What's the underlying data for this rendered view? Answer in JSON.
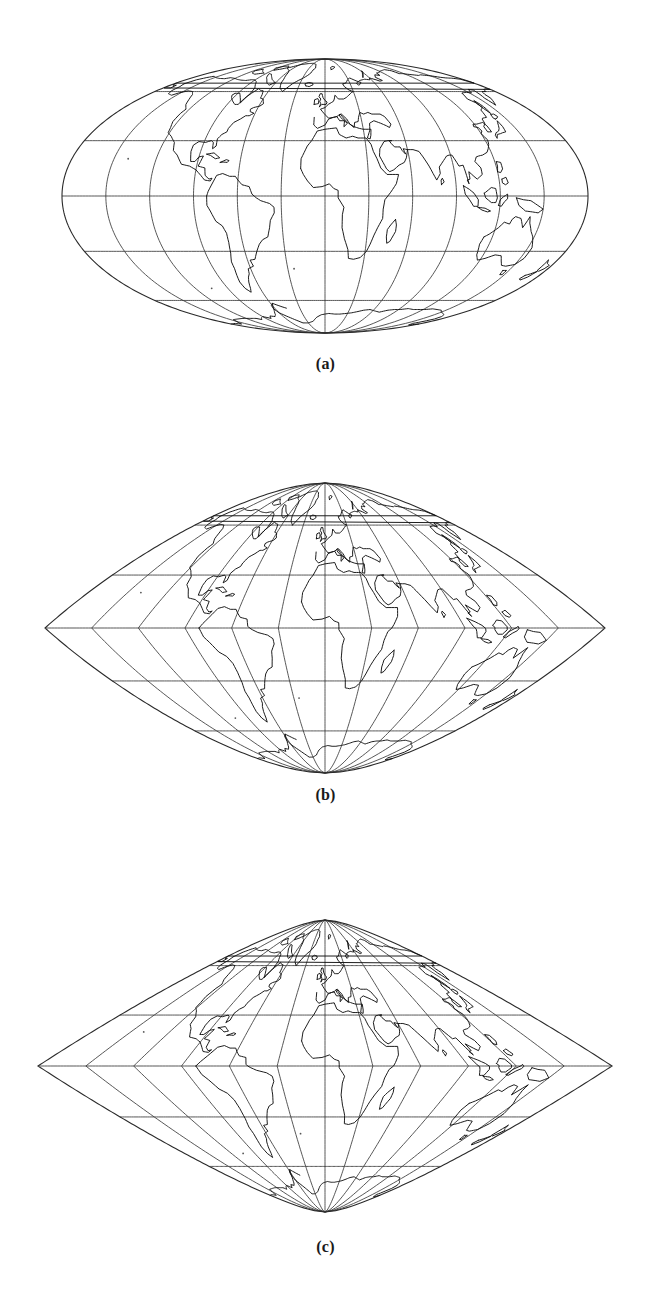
{
  "page": {
    "kind": "figure-plate",
    "background_color": "#ffffff",
    "ink_color": "#111111",
    "graticule_color": "#3a3a3a"
  },
  "figure": {
    "panels": [
      {
        "id": "a",
        "caption": "(a)",
        "projection_name": "Mollweide (flat-pole pseudocylindrical)",
        "pole_style": "flat",
        "center_x": 325,
        "center_y": 196,
        "semi_width": 263,
        "semi_height": 137
      },
      {
        "id": "b",
        "caption": "(b)",
        "projection_name": "Pointed-pole pseudocylindrical (intermediate)",
        "pole_style": "pointed",
        "center_x": 325,
        "center_y": 628,
        "semi_width": 280,
        "semi_height": 145
      },
      {
        "id": "c",
        "caption": "(c)",
        "projection_name": "Pointed-pole pseudocylindrical (sinusoidal-like)",
        "pole_style": "pointed",
        "center_x": 325,
        "center_y": 1066,
        "semi_width": 287,
        "semi_height": 146
      }
    ]
  },
  "chart_data": {
    "type": "map",
    "title": "",
    "subtitle": "",
    "map_kind": "world-graticule-coastline",
    "panel_count": 3,
    "graticule": {
      "meridian_interval_deg": 30,
      "parallel_interval_deg": 30,
      "meridians_deg": [
        -180,
        -150,
        -120,
        -90,
        -60,
        -30,
        0,
        30,
        60,
        90,
        120,
        150,
        180
      ],
      "parallels_deg": [
        60,
        30,
        0,
        -30,
        -60
      ],
      "central_meridian_deg": 0,
      "lat_range_deg": [
        -90,
        90
      ],
      "lon_range_deg": [
        -180,
        180
      ],
      "grid": true,
      "legend": "none",
      "labels_on_axes": false
    },
    "panels": [
      {
        "id": "a",
        "label": "(a)",
        "pole_style": "flat",
        "pole_width_fraction_of_equator": 0.0,
        "boundary_shape": "ellipse"
      },
      {
        "id": "b",
        "label": "(b)",
        "pole_style": "pointed",
        "pole_width_fraction_of_equator": 0.0,
        "boundary_shape": "lens-ogive"
      },
      {
        "id": "c",
        "label": "(c)",
        "pole_style": "pointed",
        "pole_width_fraction_of_equator": 0.0,
        "boundary_shape": "lens-sinusoidal"
      }
    ],
    "landmasses_depicted": [
      "North America",
      "South America",
      "Greenland",
      "Europe",
      "Africa",
      "Asia",
      "Australia",
      "Antarctica",
      "Madagascar",
      "Japan",
      "New Zealand",
      "Iceland",
      "British Isles",
      "Indonesia",
      "Philippines"
    ]
  }
}
